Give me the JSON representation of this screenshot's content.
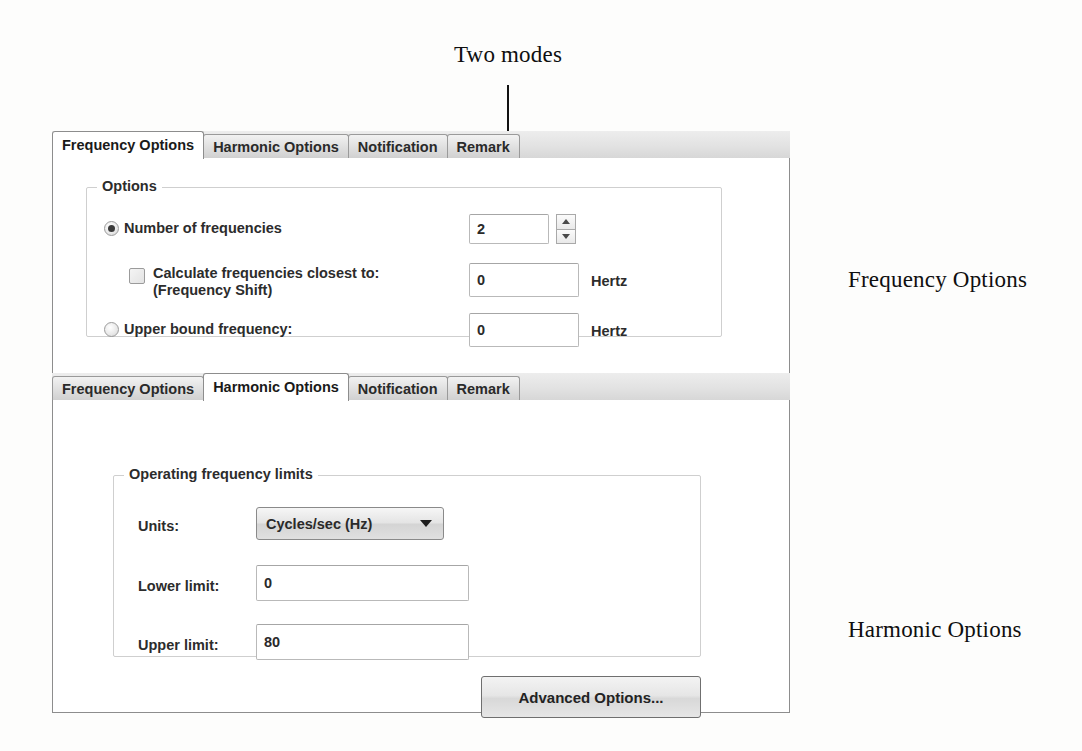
{
  "annotations": {
    "two_modes": "Two modes",
    "frequency_options": "Frequency Options",
    "harmonic_options": "Harmonic Options"
  },
  "frequency_panel": {
    "tabs": [
      {
        "label": "Frequency Options",
        "active": true
      },
      {
        "label": "Harmonic Options",
        "active": false
      },
      {
        "label": "Notification",
        "active": false
      },
      {
        "label": "Remark",
        "active": false
      }
    ],
    "group_title": "Options",
    "number_of_frequencies": {
      "label": "Number of frequencies",
      "selected": true,
      "value": "2"
    },
    "calculate_closest": {
      "label_line1": "Calculate frequencies closest to:",
      "label_line2": "(Frequency Shift)",
      "checked": false,
      "value": "0",
      "unit": "Hertz"
    },
    "upper_bound": {
      "label": "Upper bound frequency:",
      "selected": false,
      "value": "0",
      "unit": "Hertz"
    }
  },
  "harmonic_panel": {
    "tabs": [
      {
        "label": "Frequency Options",
        "active": false
      },
      {
        "label": "Harmonic Options",
        "active": true
      },
      {
        "label": "Notification",
        "active": false
      },
      {
        "label": "Remark",
        "active": false
      }
    ],
    "group_title": "Operating frequency limits",
    "units": {
      "label": "Units:",
      "value": "Cycles/sec (Hz)"
    },
    "lower_limit": {
      "label": "Lower limit:",
      "value": "0"
    },
    "upper_limit": {
      "label": "Upper limit:",
      "value": "80"
    },
    "advanced_button": "Advanced Options..."
  }
}
